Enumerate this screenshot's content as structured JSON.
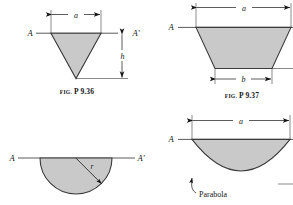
{
  "page": {
    "background_color": "#ffffff",
    "ink_color": "#141414",
    "fill_color": "#c9c9c9",
    "outline_color": "#3b3b3b"
  },
  "figures": [
    {
      "id": "fig-p936",
      "caption_prefix": "FIG.",
      "caption_number": "P 9.36",
      "shape": "inverted-triangle",
      "axis_left_label": "A",
      "axis_right_label": "A'",
      "dimensions": [
        {
          "name": "width",
          "label": "a",
          "orientation": "horizontal"
        },
        {
          "name": "height",
          "label": "h",
          "orientation": "vertical"
        }
      ]
    },
    {
      "id": "fig-p937",
      "caption_prefix": "FIG.",
      "caption_number": "P 9.37",
      "shape": "trapezoid",
      "axis_left_label": "A",
      "axis_right_label": "",
      "dimensions": [
        {
          "name": "top-width",
          "label": "a",
          "orientation": "horizontal"
        },
        {
          "name": "bottom-width",
          "label": "b",
          "orientation": "horizontal"
        }
      ]
    },
    {
      "id": "fig-semicircle",
      "caption_prefix": "",
      "caption_number": "",
      "shape": "semicircle",
      "axis_left_label": "A",
      "axis_right_label": "A'",
      "dimensions": [
        {
          "name": "radius",
          "label": "r",
          "orientation": "radial"
        }
      ]
    },
    {
      "id": "fig-parabola",
      "caption_prefix": "",
      "caption_number": "",
      "shape": "parabolic-segment",
      "axis_left_label": "A",
      "axis_right_label": "",
      "annotation": "Parabola",
      "dimensions": [
        {
          "name": "width",
          "label": "a",
          "orientation": "horizontal"
        }
      ]
    }
  ]
}
